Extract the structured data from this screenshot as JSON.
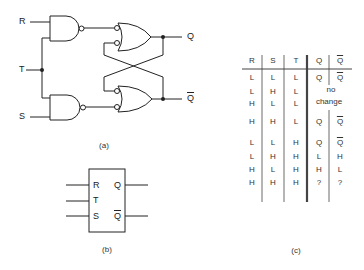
{
  "figure_a": {
    "caption": "(a)",
    "inputs": {
      "r": "R",
      "t": "T",
      "s": "S"
    },
    "outputs": {
      "q": "Q",
      "qbar": "Q"
    }
  },
  "figure_b": {
    "caption": "(b)",
    "pins": {
      "r": "R",
      "t": "T",
      "s": "S",
      "q": "Q",
      "qbar": "Q"
    }
  },
  "figure_c": {
    "caption": "(c)",
    "headers": [
      "R",
      "S",
      "T",
      "Q",
      "Q"
    ],
    "rows": [
      [
        "L",
        "L",
        "L",
        "Q",
        "Q"
      ],
      [
        "L",
        "H",
        "L",
        "no",
        ""
      ],
      [
        "H",
        "L",
        "L",
        "change",
        ""
      ],
      [
        "H",
        "H",
        "L",
        "Q",
        "Q"
      ],
      [
        "L",
        "L",
        "H",
        "Q",
        "Q"
      ],
      [
        "L",
        "H",
        "H",
        "L",
        "H"
      ],
      [
        "H",
        "L",
        "H",
        "H",
        "L"
      ],
      [
        "H",
        "H",
        "H",
        "?",
        "?"
      ]
    ]
  }
}
